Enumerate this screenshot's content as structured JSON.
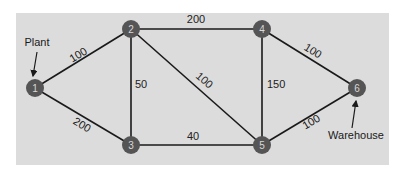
{
  "colors": {
    "panel": "#dcdcdc",
    "edge": "#1a1a1a",
    "node_fill": "#555555",
    "node_text": "#d8d8d8"
  },
  "annotations": {
    "source_label": "Plant",
    "sink_label": "Warehouse"
  },
  "nodes": [
    {
      "id": "1",
      "label": "1",
      "x": 35,
      "y": 88
    },
    {
      "id": "2",
      "label": "2",
      "x": 131,
      "y": 29
    },
    {
      "id": "3",
      "label": "3",
      "x": 131,
      "y": 145
    },
    {
      "id": "4",
      "label": "4",
      "x": 262,
      "y": 29
    },
    {
      "id": "5",
      "label": "5",
      "x": 262,
      "y": 145
    },
    {
      "id": "6",
      "label": "6",
      "x": 357,
      "y": 88
    }
  ],
  "edges": [
    {
      "from": "1",
      "to": "2",
      "weight": "100"
    },
    {
      "from": "1",
      "to": "3",
      "weight": "200"
    },
    {
      "from": "2",
      "to": "3",
      "weight": "50"
    },
    {
      "from": "2",
      "to": "4",
      "weight": "200"
    },
    {
      "from": "2",
      "to": "5",
      "weight": "100"
    },
    {
      "from": "3",
      "to": "5",
      "weight": "40"
    },
    {
      "from": "4",
      "to": "5",
      "weight": "150"
    },
    {
      "from": "4",
      "to": "6",
      "weight": "100"
    },
    {
      "from": "5",
      "to": "6",
      "weight": "100"
    }
  ]
}
